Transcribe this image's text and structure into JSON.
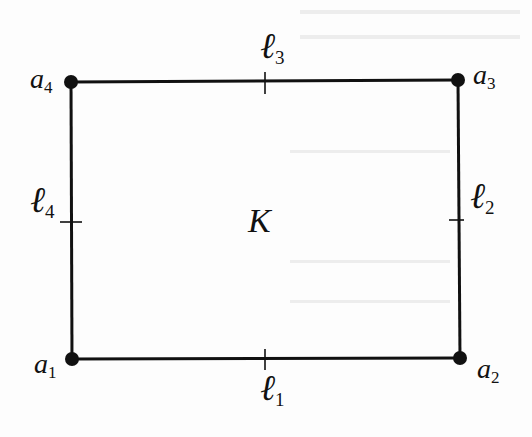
{
  "diagram": {
    "region_label": "K",
    "vertices": [
      {
        "name": "a",
        "sub": "1",
        "x": 72,
        "y": 359
      },
      {
        "name": "a",
        "sub": "2",
        "x": 460,
        "y": 358
      },
      {
        "name": "a",
        "sub": "3",
        "x": 458,
        "y": 80
      },
      {
        "name": "a",
        "sub": "4",
        "x": 71,
        "y": 82
      }
    ],
    "edges": [
      {
        "name": "ℓ",
        "sub": "1"
      },
      {
        "name": "ℓ",
        "sub": "2"
      },
      {
        "name": "ℓ",
        "sub": "3"
      },
      {
        "name": "ℓ",
        "sub": "4"
      }
    ],
    "colors": {
      "stroke": "#111111",
      "background": "#fdfdfd"
    }
  }
}
